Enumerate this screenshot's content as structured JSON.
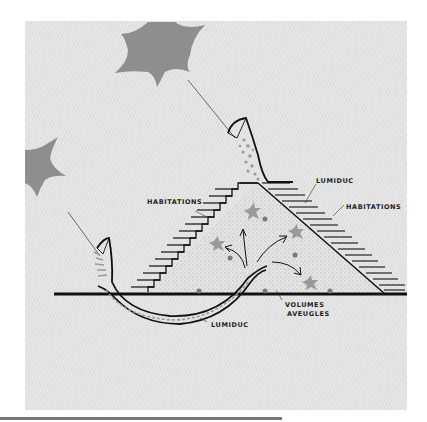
{
  "diagram": {
    "labels": {
      "lumiduc_top": "LUMIDUC",
      "habitations_left": "HABITATIONS",
      "habitations_right": "HABITATIONS",
      "volumes_line1": "VOLUMES",
      "volumes_line2": "AVEUGLES",
      "lumiduc_bottom": "LUMIDUC"
    },
    "colors": {
      "background": "#e3e3e3",
      "ink": "#111111",
      "sun": "#8e8e8e",
      "star": "#9a9a9a",
      "dot": "#7a7a7a",
      "bottom_bar": "#777777"
    },
    "elements": {
      "suns": [
        "sun-top",
        "sun-left"
      ],
      "light_rays": 2,
      "lumiducs": 2,
      "stars_inside": 4,
      "dots_inside": 6
    }
  }
}
